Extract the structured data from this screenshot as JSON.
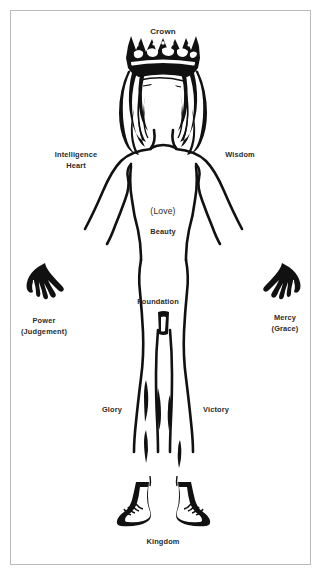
{
  "diagram": {
    "ink_color": "#111111",
    "label_color": "#2b2b2b",
    "border_color": "#b9b9b9",
    "background_color": "#ffffff"
  },
  "labels": {
    "crown": {
      "text": "Crown",
      "x": 163,
      "y": 27
    },
    "intelligence": {
      "text": "Intelligence",
      "sub": "Heart",
      "x": 76,
      "y": 150
    },
    "wisdom": {
      "text": "Wisdom",
      "x": 240,
      "y": 150
    },
    "love": {
      "text": "(Love)",
      "x": 163,
      "y": 205
    },
    "beauty": {
      "text": "Beauty",
      "x": 163,
      "y": 227
    },
    "power": {
      "text": "Power",
      "sub": "(Judgement)",
      "x": 44,
      "y": 316
    },
    "mercy": {
      "text": "Mercy",
      "sub": "(Grace)",
      "x": 285,
      "y": 313
    },
    "foundation": {
      "text": "Foundation",
      "x": 158,
      "y": 297
    },
    "glory": {
      "text": "Glory",
      "x": 112,
      "y": 405
    },
    "victory": {
      "text": "Victory",
      "x": 216,
      "y": 405
    },
    "kingdom": {
      "text": "Kingdom",
      "x": 163,
      "y": 537
    }
  },
  "figure": {
    "parts": [
      "crown",
      "hair",
      "face",
      "neck",
      "shoulders",
      "torso",
      "left-arm",
      "right-arm",
      "left-hand",
      "right-hand",
      "left-leg",
      "right-leg",
      "left-foot",
      "right-foot",
      "groin"
    ]
  }
}
